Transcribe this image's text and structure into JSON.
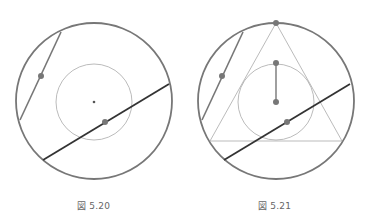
{
  "figures": [
    {
      "caption": "図 5.20"
    },
    {
      "caption": "図 5.21"
    }
  ],
  "colors": {
    "outer_circle": "#777777",
    "thin": "#aaaaaa",
    "bold_chord": "#333333",
    "dot": "#777777"
  }
}
